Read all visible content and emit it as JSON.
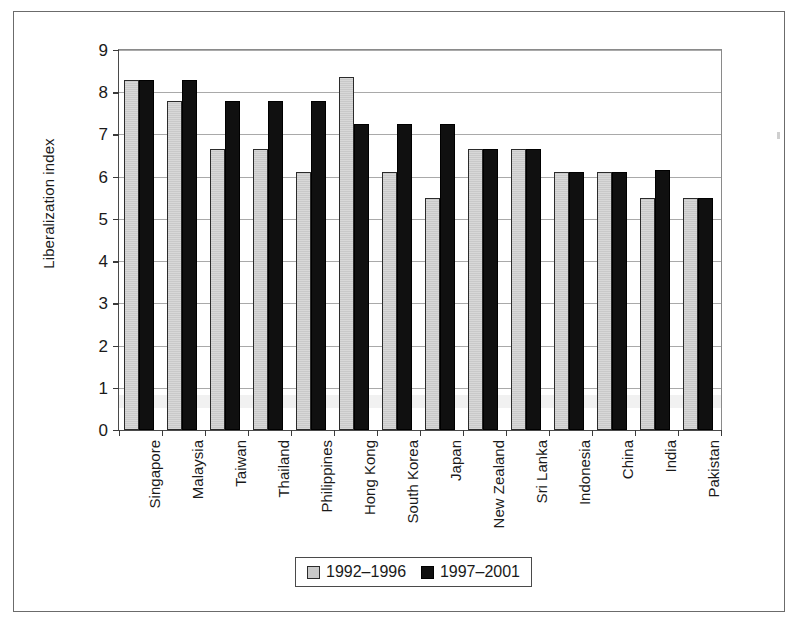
{
  "chart_data": {
    "type": "bar",
    "title": "",
    "xlabel": "",
    "ylabel": "Liberalization index",
    "ylim": [
      0,
      9
    ],
    "ytick_labels": [
      "0",
      "1",
      "2",
      "3",
      "4",
      "5",
      "6",
      "7",
      "8",
      "9"
    ],
    "grid": true,
    "legend_position": "bottom",
    "categories": [
      "Singapore",
      "Malaysia",
      "Taiwan",
      "Thailand",
      "Philippines",
      "Hong Kong",
      "South Korea",
      "Japan",
      "New Zealand",
      "Sri Lanka",
      "Indonesia",
      "China",
      "India",
      "Pakistan"
    ],
    "series": [
      {
        "name": "1992–1996",
        "color": "#c9c9c9",
        "values": [
          8.3,
          7.8,
          6.65,
          6.65,
          6.1,
          8.35,
          6.1,
          5.5,
          6.65,
          6.65,
          6.1,
          6.1,
          5.5,
          5.5
        ]
      },
      {
        "name": "1997–2001",
        "color": "#101010",
        "values": [
          8.3,
          8.3,
          7.8,
          7.8,
          7.8,
          7.25,
          7.25,
          7.25,
          6.65,
          6.65,
          6.1,
          6.1,
          6.15,
          5.5
        ]
      }
    ]
  },
  "legend": {
    "entries": [
      {
        "label": "1992–1996",
        "swatch": "light-gray-square"
      },
      {
        "label": "1997–2001",
        "swatch": "black-square"
      }
    ]
  }
}
